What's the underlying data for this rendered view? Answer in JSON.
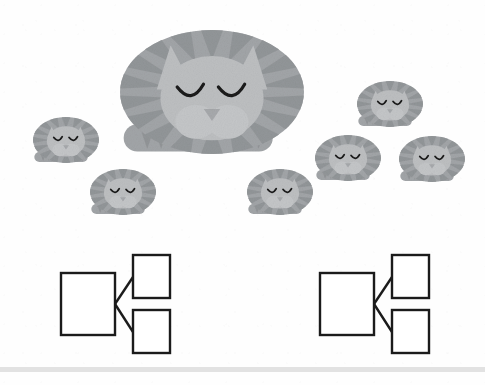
{
  "canvas": {
    "width": 485,
    "height": 385,
    "background_color": "#fdfdfd"
  },
  "illustration": {
    "name": "sleeping-cat-family",
    "subject": "mother cat with six kittens",
    "palette": {
      "body_light": "#b3b5b7",
      "body_mid": "#a2a5a8",
      "stripe_dark": "#8f9295",
      "face_light": "#bdbfc1",
      "muzzle": "#c4c6c8",
      "outline": "#9a9d9f",
      "eye": "#1a1a1a"
    },
    "mother_cat": {
      "name": "mother-cat",
      "cx": 212,
      "cy": 92,
      "rx": 92,
      "ry": 62,
      "stripe_count": 18,
      "eyes": "closed",
      "tail": "wrapped-front"
    },
    "kittens": [
      {
        "name": "kitten-left-upper",
        "cx": 66,
        "cy": 140,
        "rx": 33,
        "ry": 23,
        "stripe_count": 16
      },
      {
        "name": "kitten-left-lower",
        "cx": 123,
        "cy": 192,
        "rx": 33,
        "ry": 23,
        "stripe_count": 16
      },
      {
        "name": "kitten-center-lower",
        "cx": 280,
        "cy": 192,
        "rx": 33,
        "ry": 23,
        "stripe_count": 16
      },
      {
        "name": "kitten-right-top",
        "cx": 390,
        "cy": 104,
        "rx": 33,
        "ry": 23,
        "stripe_count": 16
      },
      {
        "name": "kitten-right-mid",
        "cx": 348,
        "cy": 158,
        "rx": 33,
        "ry": 23,
        "stripe_count": 16
      },
      {
        "name": "kitten-right-far",
        "cx": 432,
        "cy": 159,
        "rx": 33,
        "ry": 23,
        "stripe_count": 16
      }
    ]
  },
  "diagrams": {
    "stroke_color": "#1b1b1b",
    "fill_color": "#ffffff",
    "stroke_width": 2.4,
    "items": [
      {
        "name": "diagram-left",
        "parent_box": {
          "name": "parent-box",
          "x": 61,
          "y": 273,
          "w": 54,
          "h": 62
        },
        "child_boxes": [
          {
            "name": "child-box-top",
            "x": 133,
            "y": 255,
            "w": 37,
            "h": 43
          },
          {
            "name": "child-box-bottom",
            "x": 133,
            "y": 310,
            "w": 37,
            "h": 43
          }
        ],
        "junction": {
          "x": 115,
          "y": 304
        },
        "connectors": [
          {
            "name": "connector-to-top",
            "from": [
              115,
              304
            ],
            "to": [
              133,
              277
            ]
          },
          {
            "name": "connector-to-bottom",
            "from": [
              115,
              304
            ],
            "to": [
              133,
              332
            ]
          }
        ]
      },
      {
        "name": "diagram-right",
        "parent_box": {
          "name": "parent-box",
          "x": 320,
          "y": 273,
          "w": 54,
          "h": 62
        },
        "child_boxes": [
          {
            "name": "child-box-top",
            "x": 392,
            "y": 255,
            "w": 37,
            "h": 43
          },
          {
            "name": "child-box-bottom",
            "x": 392,
            "y": 310,
            "w": 37,
            "h": 43
          }
        ],
        "junction": {
          "x": 374,
          "y": 304
        },
        "connectors": [
          {
            "name": "connector-to-top",
            "from": [
              374,
              304
            ],
            "to": [
              392,
              277
            ]
          },
          {
            "name": "connector-to-bottom",
            "from": [
              374,
              304
            ],
            "to": [
              392,
              332
            ]
          }
        ]
      }
    ]
  },
  "footer": {
    "name": "footer-rule",
    "color": "#e2e2e2",
    "y": 367,
    "height": 5
  }
}
